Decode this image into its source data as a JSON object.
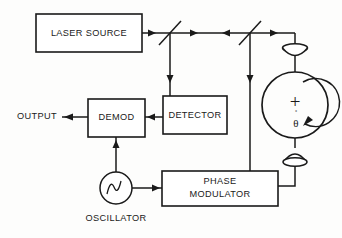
{
  "diagram": {
    "background_color": "#fdfdfc",
    "line_color": "#1a1a1a",
    "blocks": [
      {
        "id": "laser_source",
        "label": "LASER SOURCE"
      },
      {
        "id": "detector",
        "label": "DETECTOR"
      },
      {
        "id": "demod",
        "label": "DEMOD"
      },
      {
        "id": "phase_modulator",
        "label_line1": "PHASE",
        "label_line2": "MODULATOR"
      }
    ],
    "labels": {
      "output": "OUTPUT",
      "oscillator": "OSCILLATOR"
    },
    "coil": {
      "plus_symbol": "+",
      "rate_symbol": "θ",
      "rate_dot": "˚"
    },
    "components": {
      "beam_splitter_1": "beam-splitter",
      "beam_splitter_2": "beam-splitter",
      "lens_top": "lens",
      "lens_bottom": "lens",
      "oscillator_waveform": "sine-wave"
    }
  }
}
